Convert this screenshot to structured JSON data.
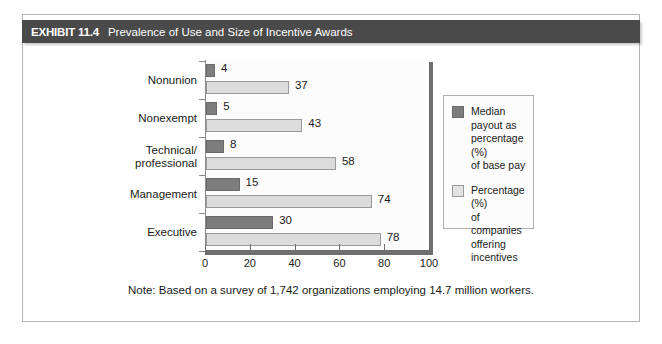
{
  "exhibit": {
    "number_label": "EXHIBIT 11.4",
    "title": "Prevalence of Use and Size of Incentive Awards",
    "note": "Note: Based on a survey of 1,742 organizations employing 14.7 million workers."
  },
  "colors": {
    "header_bar": "#4a4a4a",
    "series_dark": "#7d7d7d",
    "series_light": "#dcdcdc",
    "frame_border": "#b5b5b5",
    "axis": "#6e6e6e"
  },
  "chart_data": {
    "type": "bar",
    "orientation": "horizontal",
    "title": "Prevalence of Use and Size of Incentive Awards",
    "xlabel": "",
    "ylabel": "",
    "xlim": [
      0,
      100
    ],
    "xticks": [
      0,
      20,
      40,
      60,
      80,
      100
    ],
    "xtick_labels": [
      "0",
      "20",
      "40",
      "60",
      "80",
      "100"
    ],
    "grid": false,
    "legend_position": "right",
    "categories": [
      "Nonunion",
      "Nonexempt",
      "Technical/\nprofessional",
      "Management",
      "Executive"
    ],
    "series": [
      {
        "name": "Median payout as percentage (%) of base pay",
        "color": "#7d7d7d",
        "values": [
          4,
          5,
          8,
          15,
          30
        ],
        "value_labels": [
          "4",
          "5",
          "8",
          "15",
          "30"
        ]
      },
      {
        "name": "Percentage (%) of companies offering incentives",
        "color": "#dcdcdc",
        "values": [
          37,
          43,
          58,
          74,
          78
        ],
        "value_labels": [
          "37",
          "43",
          "58",
          "74",
          "78"
        ]
      }
    ],
    "annotations": [
      "Note: Based on a survey of 1,742 organizations employing 14.7 million workers."
    ]
  },
  "legend": {
    "items": [
      {
        "label": "Median\npayout as\npercentage (%)\nof base pay",
        "swatch": "dark"
      },
      {
        "label": "Percentage (%)\nof companies\noffering\nincentives",
        "swatch": "light"
      }
    ]
  }
}
